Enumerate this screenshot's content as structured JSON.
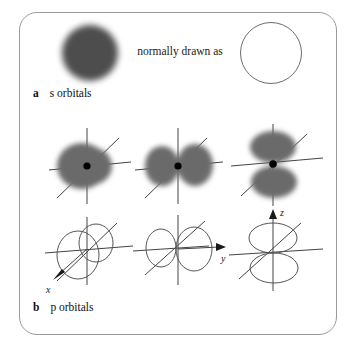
{
  "figure": {
    "background_color": "#ffffff",
    "frame_color": "#9a9a9a",
    "cloud_color": "#6a6a6a",
    "sphere_color": "#4d4d4d",
    "outline_color": "#555555",
    "axis_color": "#444444",
    "nucleus_color": "#000000"
  },
  "panel_a": {
    "caption_letter": "a",
    "caption_text": "s orbitals",
    "annotation": "normally drawn as",
    "items": [
      {
        "name": "s-orbital-electron-density-sphere",
        "style": "filled-blurred-sphere"
      },
      {
        "name": "s-orbital-schematic-circle",
        "style": "open-outline-circle"
      }
    ]
  },
  "panel_b": {
    "caption_letter": "b",
    "caption_text": "p orbitals",
    "density_row": [
      {
        "name": "px-orbital-density",
        "orientation": "x",
        "lobes": 2,
        "view": "head-on"
      },
      {
        "name": "py-orbital-density",
        "orientation": "y",
        "lobes": 2,
        "view": "horizontal-pair"
      },
      {
        "name": "pz-orbital-density",
        "orientation": "z",
        "lobes": 2,
        "view": "vertical-pair"
      }
    ],
    "outline_row": [
      {
        "name": "px-orbital-outline",
        "orientation": "x",
        "lobes": 2,
        "axis_label": "x",
        "arrow_direction": "down-left"
      },
      {
        "name": "py-orbital-outline",
        "orientation": "y",
        "lobes": 2,
        "axis_label": "y",
        "arrow_direction": "right"
      },
      {
        "name": "pz-orbital-outline",
        "orientation": "z",
        "lobes": 2,
        "axis_label": "z",
        "arrow_direction": "up"
      }
    ],
    "axis_labels": {
      "x": "x",
      "y": "y",
      "z": "z"
    }
  }
}
